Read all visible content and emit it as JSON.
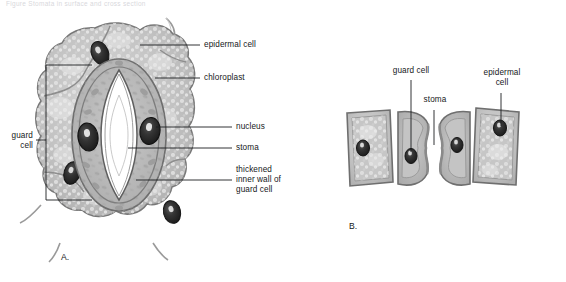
{
  "figure": {
    "header_text": "Figure  Stomata in surface and cross section",
    "panels": [
      {
        "id": "A",
        "letter": "A.",
        "caption": "surface view of a stoma"
      },
      {
        "id": "B",
        "letter": "B.",
        "caption": "cross section through a stoma"
      }
    ]
  },
  "panel_a": {
    "letter": "A.",
    "labels": {
      "epidermal_cell": "epidermal cell",
      "chloroplast": "chloroplast",
      "nucleus": "nucleus",
      "stoma": "stoma",
      "thickened_wall": "thickened\ninner wall of\nguard cell",
      "guard_cell": "guard\ncell"
    }
  },
  "panel_b": {
    "letter": "B.",
    "labels": {
      "guard_cell": "guard cell",
      "stoma": "stoma",
      "epidermal_cell": "epidermal\ncell"
    }
  },
  "colors": {
    "line": "#1b1d1f",
    "text": "#16181a",
    "cell_fill": "#b9b9b9",
    "cell_fill_light": "#cfcfcf",
    "cell_wall": "#8f8f8f",
    "nucleus": "#2b2b2b",
    "stoma_pore": "#ffffff",
    "background": "#ffffff"
  }
}
